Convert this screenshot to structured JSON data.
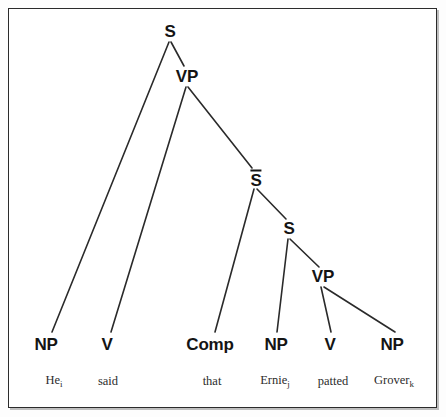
{
  "figure": {
    "kind": "syntax-tree-diagram",
    "caption": "",
    "colors": {
      "background": "#ffffff",
      "frame": "#2b2b2b",
      "line": "#2a2a2a",
      "node_text": "#141414",
      "word_text": "#2c2c2c"
    }
  },
  "chart_data": {
    "type": "tree",
    "title": "",
    "sentence": "He said that Ernie patted Grover",
    "nodes": [
      {
        "id": "S1",
        "label": "S",
        "x": 170,
        "y": 32,
        "level": 0
      },
      {
        "id": "VP1",
        "label": "VP",
        "x": 187,
        "y": 77,
        "level": 1
      },
      {
        "id": "SBAR",
        "label": "S̅",
        "x": 256,
        "y": 179,
        "level": 2
      },
      {
        "id": "S2",
        "label": "S",
        "x": 289,
        "y": 229,
        "level": 3
      },
      {
        "id": "VP2",
        "label": "VP",
        "x": 323,
        "y": 277,
        "level": 4
      },
      {
        "id": "NP1",
        "label": "NP",
        "x": 46,
        "y": 345,
        "level": 5
      },
      {
        "id": "V1",
        "label": "V",
        "x": 107,
        "y": 345,
        "level": 5
      },
      {
        "id": "COMP",
        "label": "Comp",
        "x": 210,
        "y": 345,
        "level": 5
      },
      {
        "id": "NP2",
        "label": "NP",
        "x": 276,
        "y": 345,
        "level": 5
      },
      {
        "id": "V2",
        "label": "V",
        "x": 330,
        "y": 345,
        "level": 5
      },
      {
        "id": "NP3",
        "label": "NP",
        "x": 392,
        "y": 345,
        "level": 5
      }
    ],
    "edges": [
      {
        "from": "S1",
        "to": "NP1",
        "x1": 169,
        "y1": 42,
        "x2": 52,
        "y2": 332
      },
      {
        "from": "S1",
        "to": "VP1",
        "x1": 171,
        "y1": 42,
        "x2": 184,
        "y2": 66
      },
      {
        "from": "VP1",
        "to": "V1",
        "x1": 186,
        "y1": 87,
        "x2": 111,
        "y2": 332
      },
      {
        "from": "VP1",
        "to": "SBAR",
        "x1": 188,
        "y1": 87,
        "x2": 252,
        "y2": 168
      },
      {
        "from": "SBAR",
        "to": "COMP",
        "x1": 254,
        "y1": 189,
        "x2": 215,
        "y2": 332
      },
      {
        "from": "SBAR",
        "to": "S2",
        "x1": 257,
        "y1": 189,
        "x2": 286,
        "y2": 219
      },
      {
        "from": "S2",
        "to": "NP2",
        "x1": 288,
        "y1": 239,
        "x2": 277,
        "y2": 332
      },
      {
        "from": "S2",
        "to": "VP2",
        "x1": 290,
        "y1": 239,
        "x2": 319,
        "y2": 267
      },
      {
        "from": "VP2",
        "to": "V2",
        "x1": 321,
        "y1": 287,
        "x2": 331,
        "y2": 332
      },
      {
        "from": "VP2",
        "to": "NP3",
        "x1": 324,
        "y1": 287,
        "x2": 395,
        "y2": 332
      }
    ],
    "terminals": [
      {
        "id": "W1",
        "text": "He",
        "subscript": "i",
        "x": 54,
        "y": 381,
        "parent": "NP1"
      },
      {
        "id": "W2",
        "text": "said",
        "subscript": "",
        "x": 108,
        "y": 381,
        "parent": "V1"
      },
      {
        "id": "W3",
        "text": "that",
        "subscript": "",
        "x": 212,
        "y": 381,
        "parent": "COMP"
      },
      {
        "id": "W4",
        "text": "Ernie",
        "subscript": "j",
        "x": 275,
        "y": 381,
        "parent": "NP2"
      },
      {
        "id": "W5",
        "text": "patted",
        "subscript": "",
        "x": 333,
        "y": 381,
        "parent": "V2"
      },
      {
        "id": "W6",
        "text": "Grover",
        "subscript": "k",
        "x": 394,
        "y": 381,
        "parent": "NP3"
      }
    ]
  }
}
